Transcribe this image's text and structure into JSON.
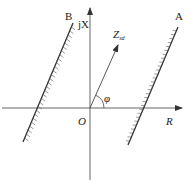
{
  "diagram": {
    "type": "impedance-plane",
    "axes": {
      "horizontal_label": "R",
      "vertical_label": "jX",
      "origin_label": "O"
    },
    "lines": [
      {
        "id": "A",
        "label": "A",
        "hatch_side": "left"
      },
      {
        "id": "B",
        "label": "B",
        "hatch_side": "right"
      }
    ],
    "vector": {
      "label_main": "Z",
      "label_sub": "sd"
    },
    "angle_label": "φ",
    "colors": {
      "stroke": "#333333",
      "text": "#222222",
      "background": "#ffffff"
    }
  }
}
